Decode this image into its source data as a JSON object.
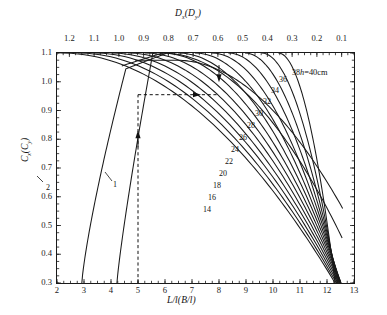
{
  "chart_data": {
    "type": "line",
    "title": "",
    "xlabel": "L/l(B/l)",
    "xlabel_top": "Dx(Dy)",
    "ylabel": "Cx(Cy)",
    "xlim": [
      2,
      13
    ],
    "ylim": [
      0.3,
      1.1
    ],
    "xticks": [
      2,
      3,
      4,
      5,
      6,
      7,
      8,
      9,
      10,
      11,
      12,
      13
    ],
    "top_axis": {
      "label": "Dx(Dy)",
      "lim": [
        1.25,
        0.05
      ],
      "ticks": [
        1.2,
        1.1,
        1.0,
        0.9,
        0.8,
        0.7,
        0.6,
        0.5,
        0.4,
        0.3,
        0.2,
        0.1
      ],
      "direction": "reversed"
    },
    "yticks": [
      0.3,
      0.4,
      0.5,
      0.6,
      0.7,
      0.8,
      0.9,
      1.0,
      1.1
    ],
    "grid": false,
    "legend": "none",
    "family_label": "h=40cm",
    "family_values": [
      14,
      16,
      18,
      20,
      22,
      24,
      26,
      28,
      30,
      32,
      34,
      36,
      38,
      40
    ],
    "left_curve_labels": [
      "1",
      "2"
    ],
    "annotations": [
      {
        "name": "dashed-vertical",
        "x": 5.0,
        "y_from": 0.3,
        "y_to": 0.955
      },
      {
        "name": "dashed-horizontal",
        "y": 0.955,
        "x_from": 5.0,
        "x_to": 8.0
      },
      {
        "name": "arrow-up-on-vertical",
        "x": 5.0,
        "y": 0.8
      },
      {
        "name": "arrow-right-on-horizontal",
        "x": 7.0,
        "y": 0.955
      },
      {
        "name": "arrow-down-at-top",
        "x": 8.0,
        "y": 1.03
      }
    ],
    "series": [
      {
        "name": "14",
        "label": "14",
        "color": "#1a1a1a"
      },
      {
        "name": "16",
        "label": "16",
        "color": "#1a1a1a"
      },
      {
        "name": "18",
        "label": "18",
        "color": "#1a1a1a"
      },
      {
        "name": "20",
        "label": "20",
        "color": "#1a1a1a"
      },
      {
        "name": "22",
        "label": "22",
        "color": "#1a1a1a"
      },
      {
        "name": "24",
        "label": "24",
        "color": "#1a1a1a"
      },
      {
        "name": "26",
        "label": "26",
        "color": "#1a1a1a"
      },
      {
        "name": "28",
        "label": "28",
        "color": "#1a1a1a"
      },
      {
        "name": "30",
        "label": "30",
        "color": "#1a1a1a"
      },
      {
        "name": "32",
        "label": "32",
        "color": "#1a1a1a"
      },
      {
        "name": "34",
        "label": "34",
        "color": "#1a1a1a"
      },
      {
        "name": "36",
        "label": "36",
        "color": "#1a1a1a"
      },
      {
        "name": "38",
        "label": "38",
        "color": "#1a1a1a"
      },
      {
        "name": "40",
        "label": "h=40cm",
        "color": "#1a1a1a"
      }
    ]
  },
  "axes": {
    "top_label_main": "D",
    "top_label_sub1": "x",
    "top_label_mid": "(D",
    "top_label_sub2": "y",
    "top_label_end": ")",
    "left_label_main": "C",
    "left_label_sub1": "x",
    "left_label_mid": "(C",
    "left_label_sub2": "y",
    "left_label_end": ")",
    "bottom_label": "L/l(B/l)"
  },
  "labels": {
    "h_prefix": "h",
    "h_value": "=40cm",
    "curve_1": "1",
    "curve_2": "2"
  }
}
